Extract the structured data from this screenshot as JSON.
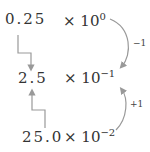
{
  "rows": [
    {
      "coefficient": "0.25",
      "times": "× 10",
      "exponent": "0"
    },
    {
      "coefficient": "2.5",
      "times": "× 10",
      "exponent": "−1"
    },
    {
      "coefficient": "25.0",
      "times": "× 10",
      "exponent": "−2"
    }
  ],
  "arrows": {
    "top_curve_label": "−1",
    "bottom_curve_label": "+1"
  },
  "colors": {
    "text": "#333333",
    "arrow": "#999999"
  }
}
